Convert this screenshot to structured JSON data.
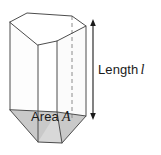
{
  "figure": {
    "name": "prism-volume-diagram",
    "background_color": "#ffffff"
  },
  "labels": {
    "length": {
      "text": "Length",
      "symbol": "l"
    },
    "area": {
      "text": "Area",
      "symbol": "A"
    }
  },
  "colors": {
    "outline": "#4d4d4d",
    "hidden_edge": "#8c8c8c",
    "base_fill": "#c9c9c9",
    "front_face_fill": "#ffffff",
    "side_face_fill": "#ffffff",
    "top_face_fill": "#ffffff",
    "arrow": "#1a1a1a",
    "text": "#1a1a1a"
  },
  "geometry": {
    "top_face": [
      [
        10,
        22
      ],
      [
        27,
        13
      ],
      [
        72,
        16
      ],
      [
        86,
        26
      ],
      [
        57,
        41
      ],
      [
        38,
        45
      ]
    ],
    "base_face": [
      [
        10,
        110
      ],
      [
        38,
        142
      ],
      [
        62,
        143
      ],
      [
        86,
        116
      ],
      [
        57,
        112
      ]
    ],
    "vertical_edges": [
      {
        "name": "left-edge",
        "from": [
          10,
          22
        ],
        "to": [
          10,
          110
        ]
      },
      {
        "name": "front-left-edge",
        "from": [
          38,
          45
        ],
        "to": [
          38,
          142
        ]
      },
      {
        "name": "front-right-edge",
        "from": [
          57,
          41
        ],
        "to": [
          57,
          112
        ]
      },
      {
        "name": "right-edge",
        "from": [
          86,
          26
        ],
        "to": [
          86,
          116
        ]
      },
      {
        "name": "hidden-back-edge",
        "from": [
          72,
          16
        ],
        "to": [
          72,
          118
        ]
      }
    ],
    "dimension_arrow": {
      "x": 93,
      "y_top": 21,
      "y_bottom": 118
    }
  }
}
